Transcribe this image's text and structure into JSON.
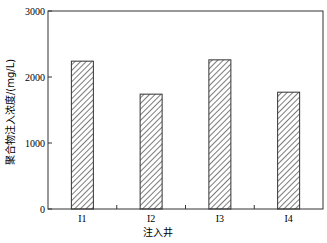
{
  "chart_data": {
    "type": "bar",
    "title": "",
    "xlabel": "注入井",
    "ylabel": "聚合物注入浓度/(mg/L)",
    "categories": [
      "I1",
      "I2",
      "I3",
      "I4"
    ],
    "values": [
      2240,
      1740,
      2260,
      1770
    ],
    "ylim": [
      0,
      3000
    ],
    "yticks": [
      "0",
      "1000",
      "2000",
      "3000"
    ],
    "grid": false,
    "legend": null,
    "bar_fill": "hatched",
    "colors": {
      "axis": "#333333",
      "bar_edge": "#333333",
      "hatch": "#444444",
      "bar_bg": "#ffffff"
    }
  }
}
